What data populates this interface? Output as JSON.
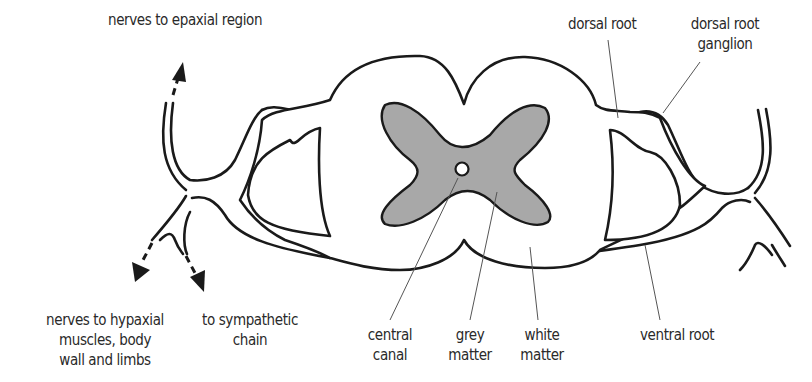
{
  "diagram": {
    "labels": {
      "epaxial": "nerves to epaxial region",
      "dorsal_root": "dorsal root",
      "dorsal_root_ganglion_1": "dorsal root",
      "dorsal_root_ganglion_2": "ganglion",
      "hypaxial_1": "nerves to hypaxial",
      "hypaxial_2": "muscles, body",
      "hypaxial_3": "wall and limbs",
      "sympathetic_1": "to sympathetic",
      "sympathetic_2": "chain",
      "central_canal_1": "central",
      "central_canal_2": "canal",
      "grey_matter_1": "grey",
      "grey_matter_2": "matter",
      "white_matter_1": "white",
      "white_matter_2": "matter",
      "ventral_root": "ventral root"
    },
    "colors": {
      "grey_matter": "#a8a8a8",
      "outline": "#1a1a1a",
      "background": "#ffffff"
    }
  }
}
